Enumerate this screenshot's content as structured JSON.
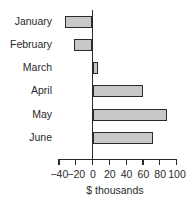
{
  "chart_data": {
    "type": "bar",
    "orientation": "horizontal",
    "title": "",
    "categories": [
      "January",
      "February",
      "March",
      "April",
      "May",
      "June"
    ],
    "values": [
      -32,
      -21,
      6,
      60,
      88,
      72
    ],
    "xlabel": "$ thousands",
    "ylabel": "",
    "xlim": [
      -40,
      100
    ],
    "xticks": [
      "-40",
      "-20",
      "0",
      "20",
      "40",
      "60",
      "80",
      "100"
    ],
    "grid": false,
    "legend": null,
    "bar_color": "#c8c8c8",
    "edge_color": "#2a2a2a"
  }
}
